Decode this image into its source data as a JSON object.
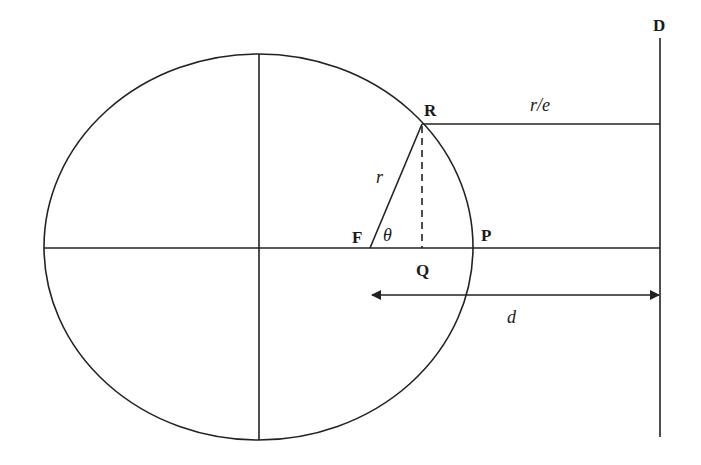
{
  "diagram": {
    "type": "ellipse-focus-directrix",
    "colors": {
      "line": "#222222",
      "text": "#1a1a1a",
      "background": "#ffffff"
    },
    "ellipse": {
      "cx": 258.5,
      "cy": 247,
      "rx": 214.5,
      "ry": 193
    },
    "points": {
      "R": {
        "label": "R",
        "x": 422,
        "y": 124
      },
      "F": {
        "label": "F",
        "x": 370,
        "y": 248
      },
      "P": {
        "label": "P",
        "x": 473,
        "y": 248
      },
      "Q": {
        "label": "Q",
        "x": 422,
        "y": 248
      },
      "D": {
        "label": "D"
      }
    },
    "labels": {
      "r": "r",
      "theta": "θ",
      "r_over_e": "r/e",
      "d": "d",
      "R": "R",
      "F": "F",
      "P": "P",
      "Q": "Q",
      "D": "D"
    },
    "directrix": {
      "x": 660,
      "y_top": 38,
      "y_bottom": 437
    },
    "distance_arrow": {
      "x_start": 372,
      "x_end": 660,
      "y": 295
    }
  }
}
